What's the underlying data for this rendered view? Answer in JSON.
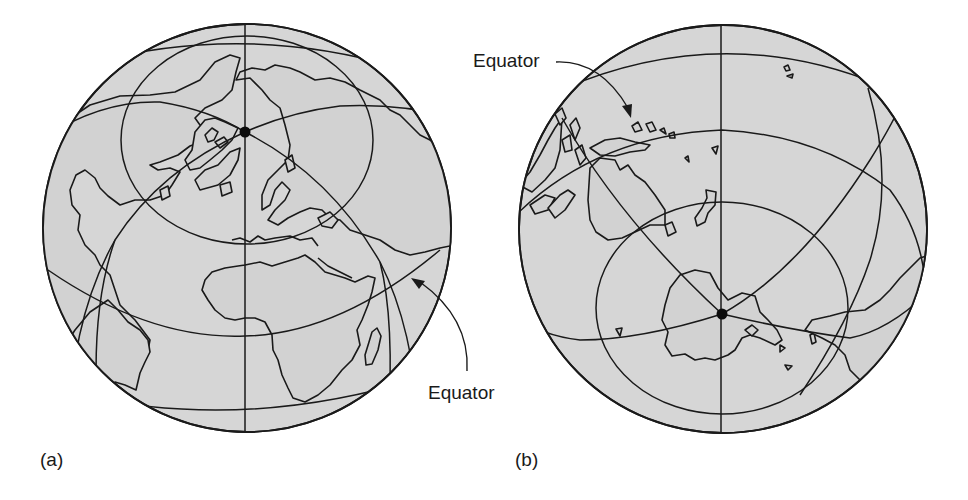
{
  "figure": {
    "panels": [
      {
        "id": "a",
        "panel_label": "(a)",
        "description": "Globe centered on the North Pole region showing Europe, Africa, North and South America",
        "pole_marker": "north-pole",
        "equator_label": "Equator"
      },
      {
        "id": "b",
        "panel_label": "(b)",
        "description": "Globe centered on the South Pole region showing Antarctica, Australia and South America",
        "pole_marker": "south-pole",
        "equator_label": "Equator"
      }
    ],
    "colors": {
      "globe_fill": "#d6d6d6",
      "line": "#1a1a1a",
      "background": "#ffffff"
    },
    "icons": {
      "pole_marker": "filled-circle",
      "callout_arrow": "curved-arrow"
    }
  }
}
